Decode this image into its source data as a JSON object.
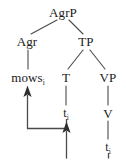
{
  "diagram": {
    "type": "syntax-tree",
    "background_color": "#ffffff",
    "line_color": "#4a4a4a",
    "text_color": "#1a1a1a",
    "highlight_color": "#e8a0d8"
  },
  "nodes": {
    "root": {
      "label": "AgrP",
      "x": 63,
      "y": 12
    },
    "agr": {
      "label": "Agr",
      "x": 27,
      "y": 41
    },
    "tp": {
      "label": "TP",
      "x": 86,
      "y": 41
    },
    "mows": {
      "label": "mows",
      "subscript": "i",
      "x": 28,
      "y": 77
    },
    "t_head": {
      "label": "T",
      "x": 66,
      "y": 77
    },
    "vp": {
      "label": "VP",
      "x": 108,
      "y": 77
    },
    "trace_t": {
      "label": "t",
      "subscript": "i",
      "x": 66,
      "y": 113
    },
    "v_head": {
      "label": "V",
      "x": 108,
      "y": 113
    },
    "trace_v": {
      "label": "t",
      "subscript": "i",
      "x": 108,
      "y": 147
    }
  },
  "branches": [
    {
      "name": "agrp-to-agr",
      "from": "AgrP",
      "to": "Agr"
    },
    {
      "name": "agrp-to-tp",
      "from": "AgrP",
      "to": "TP"
    },
    {
      "name": "agr-to-mows",
      "from": "Agr",
      "to": "mows"
    },
    {
      "name": "tp-to-t",
      "from": "TP",
      "to": "T"
    },
    {
      "name": "tp-to-vp",
      "from": "TP",
      "to": "VP"
    },
    {
      "name": "t-to-trace",
      "from": "T",
      "to": "t"
    },
    {
      "name": "vp-to-v",
      "from": "VP",
      "to": "V"
    },
    {
      "name": "v-to-trace",
      "from": "V",
      "to": "t"
    }
  ],
  "movements": [
    {
      "name": "t-to-agr-movement",
      "from": "t_i (T)",
      "to": "mows_i (Agr)",
      "arrow": "up",
      "highlighted": false
    },
    {
      "name": "v-to-t-movement",
      "from": "t_i (V)",
      "to": "t_i (T)",
      "arrow": "up",
      "highlighted": true,
      "highlight_color": "#e8a0d8"
    }
  ]
}
